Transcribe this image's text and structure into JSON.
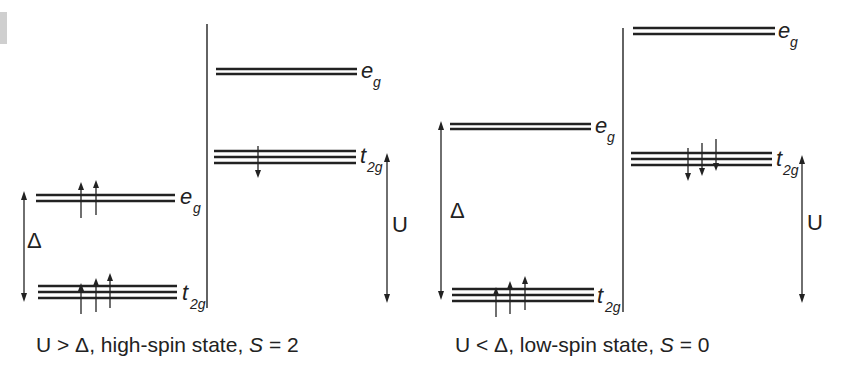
{
  "diagram": {
    "colors": {
      "line": "#222222",
      "background": "#ffffff",
      "corner_mark": "#cfcfcf"
    },
    "panels": [
      {
        "id": "high-spin",
        "caption": {
          "prefix": "U > Δ, high-spin state, ",
          "spin_symbol": "S",
          "suffix": " = 2"
        },
        "left_column": {
          "eg": {
            "label": "e",
            "sub": "g",
            "electrons": [
              "up",
              "up"
            ]
          },
          "t2g": {
            "label": "t",
            "sub": "2g",
            "electrons": [
              "up",
              "up",
              "up"
            ]
          },
          "gap_label": "Δ"
        },
        "right_column": {
          "eg": {
            "label": "e",
            "sub": "g",
            "electrons": []
          },
          "t2g": {
            "label": "t",
            "sub": "2g",
            "electrons": [
              "down"
            ]
          },
          "gap_label": "U"
        }
      },
      {
        "id": "low-spin",
        "caption": {
          "prefix": "U < Δ, low-spin state, ",
          "spin_symbol": "S",
          "suffix": " = 0"
        },
        "left_column": {
          "eg": {
            "label": "e",
            "sub": "g",
            "electrons": []
          },
          "t2g": {
            "label": "t",
            "sub": "2g",
            "electrons": [
              "up",
              "up",
              "up"
            ]
          },
          "gap_label": "Δ"
        },
        "right_column": {
          "eg": {
            "label": "e",
            "sub": "g",
            "electrons": []
          },
          "t2g": {
            "label": "t",
            "sub": "2g",
            "electrons": [
              "down",
              "down",
              "down"
            ]
          },
          "gap_label": "U"
        }
      }
    ]
  }
}
